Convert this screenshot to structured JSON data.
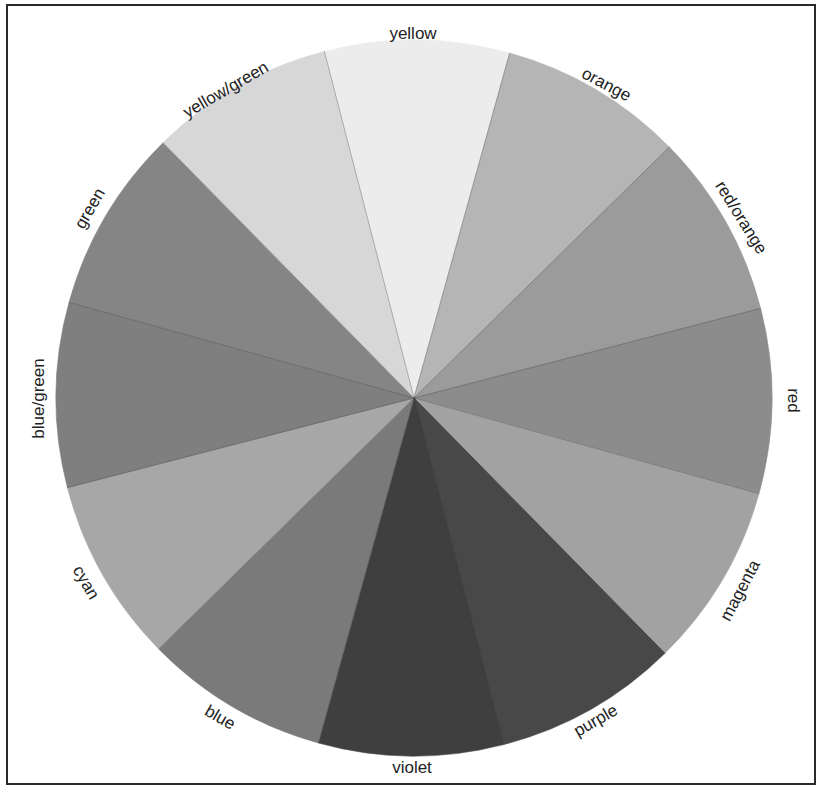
{
  "wheel": {
    "center": [
      414,
      398
    ],
    "radius": 358,
    "start_angle_deg": -14.5,
    "segment_span_deg": 30
  },
  "segments": [
    {
      "name": "yellow",
      "label": "yellow",
      "fill": "#ececec",
      "label_pos": [
        413,
        33
      ],
      "label_rot": 0
    },
    {
      "name": "orange",
      "label": "orange",
      "fill": "#b5b5b5",
      "label_pos": [
        606,
        84
      ],
      "label_rot": 28
    },
    {
      "name": "red-orange",
      "label": "red/orange",
      "fill": "#9b9b9b",
      "label_pos": [
        741,
        217
      ],
      "label_rot": 58
    },
    {
      "name": "red",
      "label": "red",
      "fill": "#8c8c8c",
      "label_pos": [
        793,
        400
      ],
      "label_rot": 90
    },
    {
      "name": "magenta",
      "label": "magenta",
      "fill": "#a2a2a2",
      "label_pos": [
        740,
        590
      ],
      "label_rot": -62
    },
    {
      "name": "purple",
      "label": "purple",
      "fill": "#484848",
      "label_pos": [
        596,
        720
      ],
      "label_rot": -30
    },
    {
      "name": "violet",
      "label": "violet",
      "fill": "#3f3f3f",
      "label_pos": [
        412,
        767
      ],
      "label_rot": 0
    },
    {
      "name": "blue",
      "label": "blue",
      "fill": "#7a7a7a",
      "label_pos": [
        220,
        717
      ],
      "label_rot": 30
    },
    {
      "name": "cyan",
      "label": "cyan",
      "fill": "#a7a7a7",
      "label_pos": [
        86,
        582
      ],
      "label_rot": 60
    },
    {
      "name": "blue-green",
      "label": "blue/green",
      "fill": "#7f7f7f",
      "label_pos": [
        38,
        398
      ],
      "label_rot": -90
    },
    {
      "name": "green",
      "label": "green",
      "fill": "#858585",
      "label_pos": [
        90,
        208
      ],
      "label_rot": -60
    },
    {
      "name": "yellow-green",
      "label": "yellow/green",
      "fill": "#d7d7d7",
      "label_pos": [
        226,
        89
      ],
      "label_rot": -30
    }
  ],
  "colors": {
    "frame": "#2a2a2a",
    "background": "#ffffff",
    "text": "#222222"
  }
}
